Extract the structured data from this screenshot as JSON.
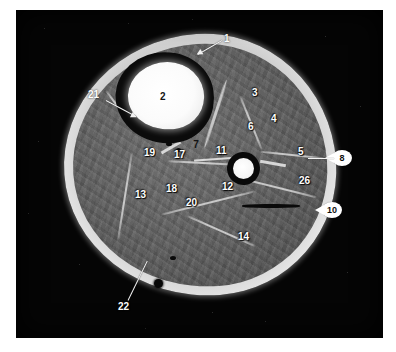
{
  "figure": {
    "modality": "MR",
    "view": "axial-cross-section",
    "region": "leg",
    "background_color": "#050505",
    "page_color": "#ffffff",
    "label_color": "#ffffff",
    "callout_color": "#ffffff"
  },
  "labels": [
    {
      "id": "label-1",
      "text": "1",
      "style": "leader-outside"
    },
    {
      "id": "label-2",
      "text": "2",
      "style": "dark-on-bright"
    },
    {
      "id": "label-3",
      "text": "3",
      "style": "plain"
    },
    {
      "id": "label-4",
      "text": "4",
      "style": "plain"
    },
    {
      "id": "label-5",
      "text": "5",
      "style": "plain"
    },
    {
      "id": "label-6",
      "text": "6",
      "style": "plain"
    },
    {
      "id": "label-7",
      "text": "7",
      "style": "dark-on-bright"
    },
    {
      "id": "label-8",
      "text": "8",
      "style": "callout"
    },
    {
      "id": "label-10",
      "text": "10",
      "style": "callout"
    },
    {
      "id": "label-11",
      "text": "11",
      "style": "plain"
    },
    {
      "id": "label-12",
      "text": "12",
      "style": "plain"
    },
    {
      "id": "label-13",
      "text": "13",
      "style": "plain"
    },
    {
      "id": "label-14",
      "text": "14",
      "style": "plain"
    },
    {
      "id": "label-17",
      "text": "17",
      "style": "plain"
    },
    {
      "id": "label-18",
      "text": "18",
      "style": "plain"
    },
    {
      "id": "label-19",
      "text": "19",
      "style": "plain"
    },
    {
      "id": "label-20",
      "text": "20",
      "style": "plain"
    },
    {
      "id": "label-21",
      "text": "21",
      "style": "leader-outside"
    },
    {
      "id": "label-22",
      "text": "22",
      "style": "leader-outside"
    },
    {
      "id": "label-26",
      "text": "26",
      "style": "plain"
    }
  ]
}
